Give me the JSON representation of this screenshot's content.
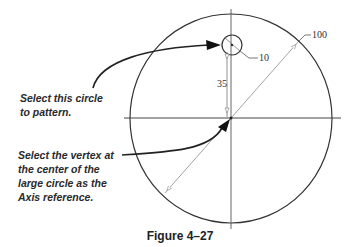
{
  "figure": {
    "caption": "Figure 4–27",
    "callouts": {
      "select_circle": [
        "Select this circle",
        "to pattern."
      ],
      "select_vertex": [
        "Select the vertex at",
        "the center of the",
        "large circle as the",
        "Axis reference."
      ]
    },
    "dimensions": {
      "small_circle_diameter": "10",
      "large_circle_diameter": "100",
      "offset_distance": "35"
    },
    "colors": {
      "line": "#333333",
      "dimension_line": "#8a8a8a",
      "text": "#2a2a2a"
    }
  }
}
